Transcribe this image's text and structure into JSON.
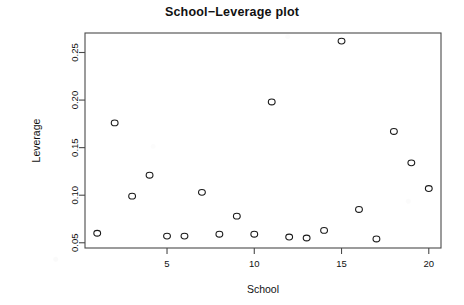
{
  "chart_data": {
    "type": "scatter",
    "title": "School−Leverage plot",
    "xlabel": "School",
    "ylabel": "Leverage",
    "xlim": [
      0.3,
      20.7
    ],
    "ylim": [
      0.0445,
      0.2705
    ],
    "grid": false,
    "legend": null,
    "xticks": [
      5,
      10,
      15,
      20
    ],
    "xtick_labels": [
      "5",
      "10",
      "15",
      "20"
    ],
    "yticks": [
      0.05,
      0.1,
      0.15,
      0.2,
      0.25
    ],
    "ytick_labels": [
      "0.05",
      "0.10",
      "0.15",
      "0.20",
      "0.25"
    ],
    "marker": "open-circle",
    "x": [
      1,
      2,
      3,
      4,
      5,
      6,
      7,
      8,
      9,
      10,
      11,
      12,
      13,
      14,
      15,
      16,
      17,
      18,
      19,
      20
    ],
    "y": [
      0.06,
      0.176,
      0.099,
      0.121,
      0.057,
      0.057,
      0.103,
      0.059,
      0.078,
      0.059,
      0.198,
      0.056,
      0.055,
      0.063,
      0.262,
      0.085,
      0.054,
      0.167,
      0.134,
      0.107
    ],
    "points": [
      {
        "school": 1,
        "leverage": 0.06
      },
      {
        "school": 2,
        "leverage": 0.176
      },
      {
        "school": 3,
        "leverage": 0.099
      },
      {
        "school": 4,
        "leverage": 0.121
      },
      {
        "school": 5,
        "leverage": 0.057
      },
      {
        "school": 6,
        "leverage": 0.057
      },
      {
        "school": 7,
        "leverage": 0.103
      },
      {
        "school": 8,
        "leverage": 0.059
      },
      {
        "school": 9,
        "leverage": 0.078
      },
      {
        "school": 10,
        "leverage": 0.059
      },
      {
        "school": 11,
        "leverage": 0.198
      },
      {
        "school": 12,
        "leverage": 0.056
      },
      {
        "school": 13,
        "leverage": 0.055
      },
      {
        "school": 14,
        "leverage": 0.063
      },
      {
        "school": 15,
        "leverage": 0.262
      },
      {
        "school": 16,
        "leverage": 0.085
      },
      {
        "school": 17,
        "leverage": 0.054
      },
      {
        "school": 18,
        "leverage": 0.167
      },
      {
        "school": 19,
        "leverage": 0.134
      },
      {
        "school": 20,
        "leverage": 0.107
      }
    ]
  },
  "colors": {
    "background": "#ffffff",
    "axis": "#4a4a4a",
    "marker": "#1a1a1a",
    "text": "#111111"
  }
}
